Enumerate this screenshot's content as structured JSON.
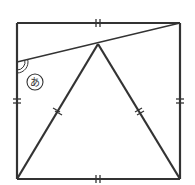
{
  "diagram": {
    "type": "geometry",
    "colors": {
      "stroke": "#333333",
      "background": "#ffffff"
    },
    "square": {
      "top_left": [
        17,
        23
      ],
      "top_right": [
        180,
        23
      ],
      "bottom_right": [
        180,
        179
      ],
      "bottom_left": [
        17,
        179
      ]
    },
    "triangle": {
      "apex": [
        98,
        44
      ],
      "base_left": [
        17,
        179
      ],
      "base_right": [
        180,
        179
      ]
    },
    "diagonal_line": {
      "from": [
        180,
        23
      ],
      "to": [
        17,
        62
      ]
    },
    "angle_marker": {
      "vertex": [
        17,
        62
      ],
      "style": "double-arc",
      "label": "あ",
      "label_center": [
        35,
        82
      ],
      "label_circle_radius": 8
    },
    "tick_marks": {
      "square_sides": "double",
      "triangle_sides": "double"
    }
  }
}
